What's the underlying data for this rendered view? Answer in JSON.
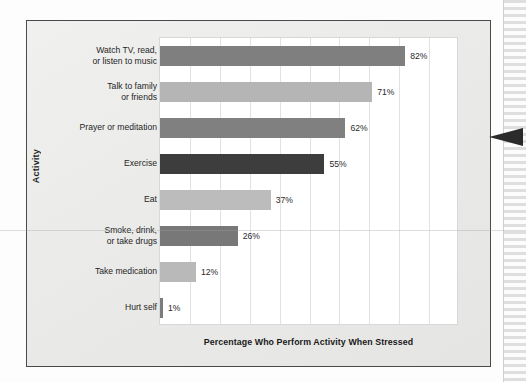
{
  "chart_data": {
    "type": "bar",
    "orientation": "horizontal",
    "title": "",
    "xlabel": "Percentage Who Perform Activity When Stressed",
    "ylabel": "Activity",
    "xlim": [
      0,
      100
    ],
    "grid": true,
    "gridline_count": 9,
    "legend": "none",
    "categories": [
      "Watch TV, read,\nor listen to music",
      "Talk to family\nor friends",
      "Prayer or meditation",
      "Exercise",
      "Eat",
      "Smoke, drink,\nor take drugs",
      "Take medication",
      "Hurt self"
    ],
    "values": [
      82,
      71,
      62,
      55,
      37,
      26,
      12,
      1
    ],
    "value_labels": [
      "82%",
      "71%",
      "62%",
      "55%",
      "37%",
      "26%",
      "12%",
      "1%"
    ],
    "bar_colors": [
      "#7f7f7f",
      "#b5b5b5",
      "#808080",
      "#3d3d3d",
      "#bcbcbc",
      "#787878",
      "#b9b9b9",
      "#7c7c7c"
    ]
  },
  "figure": {
    "frame_color": "#4a4a4a",
    "background_color": "#ededeb",
    "plot_background": "#ffffff",
    "gridline_color": "#e2e2e2"
  },
  "annotations": {
    "pointer_arrow_name": "callout-arrow",
    "pointer_arrow_color": "#2b2b2b"
  }
}
